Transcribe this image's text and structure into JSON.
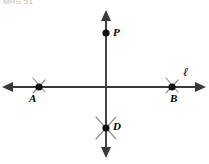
{
  "header": {
    "caption": "MRS 51"
  },
  "figure": {
    "background_color": "#ffffff",
    "line_color": "#3a3a3a",
    "arc_color": "#8e8e8e",
    "point_color": "#111111"
  },
  "labels": {
    "point_p": "P",
    "point_a": "A",
    "point_b": "B",
    "point_d": "D",
    "line_l": "ℓ"
  },
  "geometry": {
    "horizontal_line": {
      "name": "line-l",
      "x1": 2,
      "y1": 87,
      "x2": 206,
      "y2": 87,
      "arrows": "both"
    },
    "vertical_line": {
      "name": "perpendicular-line",
      "x1": 106,
      "y1": 10,
      "x2": 106,
      "y2": 158,
      "arrows": "both"
    },
    "points": [
      {
        "name": "point-p",
        "label": "P",
        "cx": 106,
        "cy": 33,
        "r": 3.6,
        "label_x": 113,
        "label_y": 28
      },
      {
        "name": "point-a",
        "label": "A",
        "cx": 39,
        "cy": 87,
        "r": 3.6,
        "label_x": 29,
        "label_y": 93
      },
      {
        "name": "point-b",
        "label": "B",
        "cx": 172,
        "cy": 87,
        "r": 3.6,
        "label_x": 170,
        "label_y": 93
      },
      {
        "name": "point-d",
        "label": "D",
        "cx": 106,
        "cy": 128,
        "r": 3.6,
        "label_x": 113,
        "label_y": 122
      }
    ],
    "arc_marks": [
      {
        "name": "arc-mark-a-upper",
        "x1": 33,
        "y1": 78,
        "x2": 45,
        "y2": 92
      },
      {
        "name": "arc-mark-a-lower",
        "x1": 33,
        "y1": 93,
        "x2": 45,
        "y2": 80
      },
      {
        "name": "arc-mark-b-upper",
        "x1": 166,
        "y1": 78,
        "x2": 178,
        "y2": 92
      },
      {
        "name": "arc-mark-b-lower",
        "x1": 166,
        "y1": 93,
        "x2": 178,
        "y2": 80
      },
      {
        "name": "arc-mark-d-upper-left",
        "x1": 96,
        "y1": 117,
        "x2": 116,
        "y2": 139
      },
      {
        "name": "arc-mark-d-upper-right",
        "x1": 116,
        "y1": 117,
        "x2": 96,
        "y2": 139
      }
    ]
  }
}
